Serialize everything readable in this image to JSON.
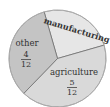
{
  "chart_data": {
    "type": "pie",
    "title": "",
    "categories": [
      "manufacturing",
      "agriculture",
      "other"
    ],
    "values": [
      3,
      5,
      4
    ],
    "fractions": [
      "3/12",
      "5/12",
      "4/12"
    ],
    "slices": [
      {
        "label": "manufacturing",
        "value": 3,
        "fraction_label": "",
        "color": "#e6e6e6",
        "start_deg": 254,
        "end_deg": 344
      },
      {
        "label": "agriculture",
        "value": 5,
        "fraction_numerator": "5",
        "fraction_denominator": "12",
        "color": "#d9d9d9",
        "start_deg": 344,
        "end_deg": 494
      },
      {
        "label": "other",
        "value": 4,
        "fraction_numerator": "4",
        "fraction_denominator": "12",
        "color": "#c4c4c4",
        "start_deg": 134,
        "end_deg": 254
      }
    ],
    "legend": "none",
    "grid": false
  },
  "labels": {
    "manufacturing": "manufacturing",
    "agriculture": "agriculture",
    "agriculture_num": "5",
    "agriculture_den": "12",
    "other": "other",
    "other_num": "4",
    "other_den": "12"
  }
}
